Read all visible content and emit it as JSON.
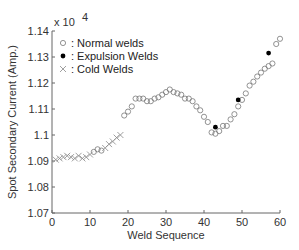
{
  "chart_data": {
    "type": "scatter",
    "title": "",
    "xlabel": "Weld Sequence",
    "ylabel": "Spot Secondary Current (Amp.)",
    "y_multiplier": "x 10^4",
    "xlim": [
      0,
      60
    ],
    "ylim": [
      1.07,
      1.14
    ],
    "xticks": [
      0,
      10,
      20,
      30,
      40,
      50,
      60
    ],
    "yticks": [
      1.07,
      1.08,
      1.09,
      1.1,
      1.11,
      1.12,
      1.13,
      1.14
    ],
    "grid": false,
    "legend_position": "upper-left",
    "series": [
      {
        "name": "Normal welds",
        "marker": "open-circle",
        "points": [
          [
            11,
            1.0935
          ],
          [
            12,
            1.0945
          ],
          [
            13,
            1.094
          ],
          [
            19,
            1.1075
          ],
          [
            20,
            1.109
          ],
          [
            21,
            1.111
          ],
          [
            22,
            1.114
          ],
          [
            23,
            1.114
          ],
          [
            24,
            1.114
          ],
          [
            25,
            1.113
          ],
          [
            26,
            1.113
          ],
          [
            27,
            1.114
          ],
          [
            28,
            1.1145
          ],
          [
            29,
            1.1155
          ],
          [
            30,
            1.1165
          ],
          [
            31,
            1.1175
          ],
          [
            32,
            1.1165
          ],
          [
            33,
            1.116
          ],
          [
            34,
            1.1155
          ],
          [
            35,
            1.114
          ],
          [
            36,
            1.114
          ],
          [
            37,
            1.113
          ],
          [
            38,
            1.111
          ],
          [
            39,
            1.1095
          ],
          [
            40,
            1.107
          ],
          [
            41,
            1.105
          ],
          [
            42,
            1.101
          ],
          [
            43,
            1.1005
          ],
          [
            44,
            1.1015
          ],
          [
            45,
            1.1035
          ],
          [
            46,
            1.1035
          ],
          [
            47,
            1.106
          ],
          [
            48,
            1.108
          ],
          [
            49,
            1.111
          ],
          [
            50,
            1.1135
          ],
          [
            51,
            1.116
          ],
          [
            52,
            1.119
          ],
          [
            53,
            1.1205
          ],
          [
            54,
            1.1225
          ],
          [
            55,
            1.124
          ],
          [
            56,
            1.1255
          ],
          [
            57,
            1.1265
          ],
          [
            58,
            1.1275
          ],
          [
            59,
            1.135
          ],
          [
            60,
            1.137
          ]
        ]
      },
      {
        "name": "Expulsion Welds",
        "marker": "filled-dot",
        "points": [
          [
            43,
            1.103
          ],
          [
            49,
            1.1135
          ],
          [
            57,
            1.1315
          ]
        ]
      },
      {
        "name": "Cold Welds",
        "marker": "x",
        "points": [
          [
            1,
            1.0905
          ],
          [
            2,
            1.091
          ],
          [
            3,
            1.0915
          ],
          [
            4,
            1.092
          ],
          [
            5,
            1.0915
          ],
          [
            6,
            1.091
          ],
          [
            7,
            1.092
          ],
          [
            8,
            1.091
          ],
          [
            9,
            1.0915
          ],
          [
            10,
            1.0925
          ],
          [
            14,
            1.095
          ],
          [
            15,
            1.0965
          ],
          [
            16,
            1.0975
          ],
          [
            17,
            1.099
          ],
          [
            18,
            1.1
          ]
        ]
      }
    ]
  },
  "legend": {
    "items": [
      {
        "label": ": Normal welds"
      },
      {
        "label": ": Expulsion Welds"
      },
      {
        "label": ": Cold Welds"
      }
    ]
  },
  "axes": {
    "multiplier_label": "x 10",
    "multiplier_exp": "4",
    "xlabel": "Weld Sequence",
    "ylabel": "Spot Secondary Current (Amp.)"
  }
}
